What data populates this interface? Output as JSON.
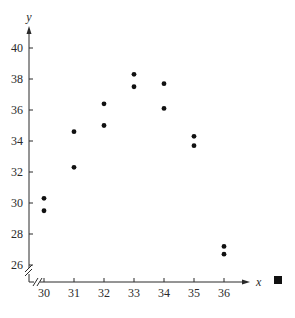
{
  "chart_data": {
    "type": "scatter",
    "title": "",
    "xlabel": "x",
    "ylabel": "y",
    "xlim": [
      29.5,
      37
    ],
    "ylim": [
      25,
      41.5
    ],
    "x_ticks": [
      30,
      31,
      32,
      33,
      34,
      35,
      36
    ],
    "y_ticks": [
      26,
      28,
      30,
      32,
      34,
      36,
      38,
      40
    ],
    "grid": false,
    "legend": null,
    "axis_breaks": {
      "x": true,
      "y": true
    },
    "end_marker": "filled-square",
    "points": [
      {
        "x": 30,
        "y": 30.3
      },
      {
        "x": 30,
        "y": 29.5
      },
      {
        "x": 31,
        "y": 34.6
      },
      {
        "x": 31,
        "y": 32.3
      },
      {
        "x": 32,
        "y": 36.4
      },
      {
        "x": 32,
        "y": 35.0
      },
      {
        "x": 33,
        "y": 38.3
      },
      {
        "x": 33,
        "y": 37.5
      },
      {
        "x": 34,
        "y": 37.7
      },
      {
        "x": 34,
        "y": 36.1
      },
      {
        "x": 35,
        "y": 34.3
      },
      {
        "x": 35,
        "y": 33.7
      },
      {
        "x": 36,
        "y": 27.2
      },
      {
        "x": 36,
        "y": 26.7
      }
    ]
  },
  "colors": {
    "axis": "#2a2a2a",
    "point": "#111111"
  }
}
